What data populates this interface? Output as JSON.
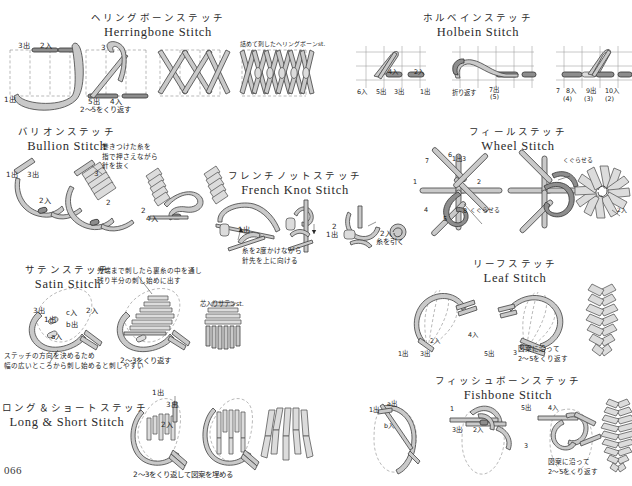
{
  "page": {
    "folio": "066",
    "background": "#ffffff",
    "ink": "#231f20",
    "thread_fill": "#c9c9c9",
    "thread_dark": "#8d8d8d",
    "guide_color": "#8a8a8a"
  },
  "sections": [
    {
      "id": "herringbone",
      "title_jp": "ヘリングボーンステッチ",
      "title_en": "Herringbone Stitch",
      "labels": {
        "out3": "3出",
        "in2": "2入",
        "out1": "1出",
        "step3": "3",
        "out5": "5出",
        "in4": "4入",
        "repeat": "2〜5をくり返す",
        "dense": "詰めて刺したヘリングボーンst."
      }
    },
    {
      "id": "holbein",
      "title_jp": "ホルベインステッチ",
      "title_en": "Holbein Stitch",
      "labels": {
        "in6": "6入",
        "out5": "5出",
        "in4": "4入",
        "out3": "3出",
        "in2": "2入",
        "out1": "1出",
        "turn": "折り返す",
        "out7": "7出",
        "bracket7": "(5)",
        "n7": "7",
        "in8": "8入",
        "out9": "9出",
        "in10": "10入",
        "b4": "(4)",
        "b3": "(3)",
        "b2": "(2)"
      }
    },
    {
      "id": "bullion",
      "title_jp": "バリオンステッチ",
      "title_en": "Bullion Stitch",
      "labels": {
        "out1": "1出",
        "out3": "3出",
        "in2": "2入",
        "n3": "3",
        "n2": "2",
        "in4": "4入",
        "note": "巻きつけた糸を\n指で押さえながら\n針を抜く",
        "note_l1": "巻きつけた糸を",
        "note_l2": "指で押さえながら",
        "note_l3": "針を抜く"
      }
    },
    {
      "id": "french_knot",
      "title_jp": "フレンチノットステッチ",
      "title_en": "French Knot Stitch",
      "labels": {
        "out1": "1出",
        "n2": "2",
        "out1b": "1出",
        "in2": "2入",
        "pull": "糸を引く",
        "note_l1": "糸を2度かけながら",
        "note_l2": "針先を上に向ける"
      }
    },
    {
      "id": "wheel",
      "title_jp": "フィールステッチ",
      "title_en": "Wheel Stitch",
      "labels": {
        "s1": "1",
        "s2": "2",
        "s3": "1出3",
        "s4": "4",
        "s5": "5",
        "s6": "6",
        "s7": "7",
        "s8": "8",
        "weave": "くぐらせる",
        "weave2": "くぐらせる",
        "in2": "2入"
      }
    },
    {
      "id": "satin",
      "title_jp": "サテンステッチ",
      "title_en": "Satin Stitch",
      "labels": {
        "out3": "3出",
        "in_c": "c入",
        "in2": "2入",
        "out1": "1出",
        "out_b": "b出",
        "in_a": "a入",
        "note_l1": "先端まで刺したら裏糸の中を通し",
        "note_l2": "残り半分の刺し始めに出す",
        "core": "芯入りサテンst.",
        "repeat": "2〜3をくり返す",
        "tip_l1": "ステッチの方向を決めるため",
        "tip_l2": "幅の広いところから刺し始めると刺しやすい"
      }
    },
    {
      "id": "leaf",
      "title_jp": "リーフステッチ",
      "title_en": "Leaf Stitch",
      "labels": {
        "out1": "1出",
        "out3": "3出",
        "in2": "2入",
        "in4": "4入",
        "out5": "5出",
        "n3": "3",
        "note_l1": "図案に沿って",
        "note_l2": "2〜5をくり返す"
      }
    },
    {
      "id": "long_short",
      "title_jp": "ロング＆ショートステッチ",
      "title_en": "Long & Short Stitch",
      "labels": {
        "out1": "1出",
        "out3": "3出",
        "in2": "2入",
        "caption": "2〜3をくり返して図案を埋める"
      }
    },
    {
      "id": "fishbone",
      "title_jp": "フィッシュボーンステッチ",
      "title_en": "Fishbone Stitch",
      "labels": {
        "out1": "1出",
        "out_a": "a出",
        "in_b": "b入",
        "n1": "1",
        "out3": "3出",
        "in2": "2入",
        "out5": "5出",
        "in4": "4入",
        "n3": "3",
        "note_l1": "図案に沿って",
        "note_l2": "2〜5をくり返す"
      }
    }
  ]
}
